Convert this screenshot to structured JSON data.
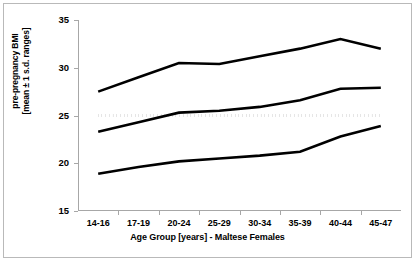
{
  "chart_data": {
    "type": "line",
    "title": "",
    "xlabel": "Age Group [years] - Maltese Females",
    "ylabel": "pre-pregnancy BMI [mean ± 1 s.d. ranges]",
    "ylabel_line1": "pre-pregnancy BMI",
    "ylabel_line2": "[mean ± 1 s.d. ranges]",
    "categories": [
      "14-16",
      "17-19",
      "20-24",
      "25-29",
      "30-34",
      "35-39",
      "40-44",
      "45-47"
    ],
    "ylim": [
      15,
      35
    ],
    "yticks": [
      15,
      20,
      25,
      30,
      35
    ],
    "ytick_labels": [
      "15",
      "20",
      "25",
      "30",
      "35"
    ],
    "grid": false,
    "legend": "none",
    "series": [
      {
        "name": "mean + 1 s.d.",
        "style": "solid",
        "color": "#000000",
        "values": [
          27.5,
          29.0,
          30.5,
          30.4,
          31.2,
          32.0,
          33.0,
          32.0
        ]
      },
      {
        "name": "mean",
        "style": "solid",
        "color": "#000000",
        "values": [
          23.3,
          24.3,
          25.3,
          25.5,
          25.9,
          26.6,
          27.8,
          27.9
        ]
      },
      {
        "name": "mean - 1 s.d.",
        "style": "solid",
        "color": "#000000",
        "values": [
          18.9,
          19.6,
          20.2,
          20.5,
          20.8,
          21.2,
          22.8,
          23.9
        ]
      },
      {
        "name": "BMI 25 reference",
        "style": "dotted",
        "color": "#000000",
        "values": [
          25.0,
          25.0,
          25.0,
          25.0,
          25.0,
          25.0,
          25.0,
          25.0
        ]
      }
    ]
  }
}
